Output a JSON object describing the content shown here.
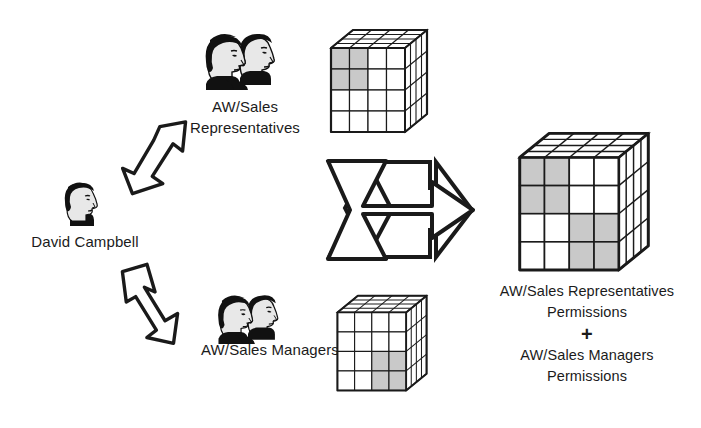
{
  "diagram": {
    "colors": {
      "stroke": "#1a1a1a",
      "cell_empty": "#ffffff",
      "cell_filled": "#c9c9c9",
      "cube_top": "#ffffff",
      "cube_side": "#ffffff",
      "hair": "#111111",
      "face": "#e8e8e8",
      "background": "#ffffff"
    }
  },
  "user": {
    "name": "David Campbell",
    "icon": "single-person-icon"
  },
  "groups": [
    {
      "id": "sales-representatives",
      "label_line1": "AW/Sales",
      "label_line2": "Representatives",
      "icon": "two-people-icon",
      "arrow": "arrow-up-right-icon"
    },
    {
      "id": "sales-managers",
      "label_line1": "AW/Sales Managers",
      "label_line2": "",
      "icon": "two-people-icon",
      "arrow": "arrow-down-right-icon"
    }
  ],
  "combine_arrow": {
    "icon": "chevron-tail-arrow-right-icon",
    "label": ""
  },
  "result": {
    "line1": "AW/Sales Representatives",
    "line2": "Permissions",
    "plus": "+",
    "line3": "AW/Sales Managers",
    "line4": "Permissions"
  },
  "cubes": [
    {
      "id": "cube-representatives-permissions",
      "name": "representatives-permissions-cube",
      "rows": 4,
      "cols": 4,
      "filled_cells": [
        [
          0,
          0
        ],
        [
          0,
          1
        ],
        [
          1,
          0
        ],
        [
          1,
          1
        ]
      ]
    },
    {
      "id": "cube-managers-permissions",
      "name": "managers-permissions-cube",
      "rows": 4,
      "cols": 4,
      "filled_cells": [
        [
          2,
          2
        ],
        [
          2,
          3
        ],
        [
          3,
          2
        ],
        [
          3,
          3
        ]
      ]
    },
    {
      "id": "cube-combined-permissions",
      "name": "combined-permissions-cube",
      "rows": 4,
      "cols": 4,
      "filled_cells": [
        [
          0,
          0
        ],
        [
          0,
          1
        ],
        [
          1,
          0
        ],
        [
          1,
          1
        ],
        [
          2,
          2
        ],
        [
          2,
          3
        ],
        [
          3,
          2
        ],
        [
          3,
          3
        ]
      ]
    }
  ]
}
